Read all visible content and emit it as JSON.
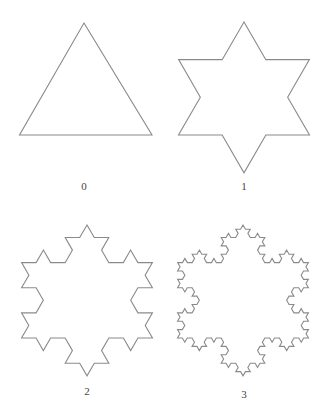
{
  "figure": {
    "stroke_color": "#8a8a8a",
    "stroke_width": 1.1,
    "panels": [
      {
        "label": "0",
        "iterations": 0,
        "vertices": [
          [
            84,
            23
          ],
          [
            152,
            135
          ],
          [
            19.5,
            135
          ]
        ],
        "label_pos": [
          84,
          186
        ]
      },
      {
        "label": "1",
        "iterations": 1,
        "vertices": [
          [
            244,
            22
          ],
          [
            309.5,
            135
          ],
          [
            178.5,
            135
          ]
        ],
        "label_pos": [
          244,
          186
        ]
      },
      {
        "label": "2",
        "iterations": 2,
        "vertices": [
          [
            87,
            225
          ],
          [
            152.5,
            338
          ],
          [
            21.5,
            338
          ]
        ],
        "label_pos": [
          87,
          391
        ]
      },
      {
        "label": "3",
        "iterations": 3,
        "vertices": [
          [
            243,
            225
          ],
          [
            308.5,
            338
          ],
          [
            177.5,
            338
          ]
        ],
        "label_pos": [
          244,
          394
        ]
      }
    ]
  }
}
